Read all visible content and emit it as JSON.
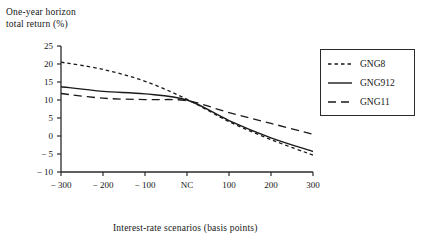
{
  "chart_data": {
    "type": "line",
    "title": "",
    "ylabel_line1": "One-year horizon",
    "ylabel_line2": "total return (%)",
    "xlabel": "Interest-rate scenarios (basis points)",
    "x": [
      -300,
      -200,
      -100,
      0,
      100,
      200,
      300
    ],
    "xtick_labels": [
      "− 300",
      "− 200",
      "− 100",
      "NC",
      "100",
      "200",
      "300"
    ],
    "ytick_labels": [
      "25",
      "20",
      "15",
      "10",
      "5",
      "0",
      "− 5",
      "− 10"
    ],
    "ytick_values": [
      25,
      20,
      15,
      10,
      5,
      0,
      -5,
      -10
    ],
    "ylim": [
      -10,
      25
    ],
    "xlim": [
      -300,
      300
    ],
    "grid": false,
    "legend_position": "right",
    "series": [
      {
        "name": "GNG8",
        "style": "short-dash",
        "values": [
          20.5,
          18.5,
          15.2,
          10.2,
          4.0,
          -1.0,
          -5.3
        ]
      },
      {
        "name": "GNG912",
        "style": "solid",
        "values": [
          13.7,
          12.4,
          11.7,
          10.0,
          4.3,
          -0.5,
          -4.3
        ]
      },
      {
        "name": "GNG11",
        "style": "long-dash",
        "values": [
          11.8,
          10.5,
          10.1,
          9.8,
          6.5,
          3.5,
          0.5
        ]
      }
    ]
  },
  "legend": {
    "items": [
      {
        "label": "GNG8"
      },
      {
        "label": "GNG912"
      },
      {
        "label": "GNG11"
      }
    ]
  },
  "colors": {
    "ink": "#1a1a1a",
    "axis": "#2a2a2a",
    "background": "#ffffff"
  }
}
